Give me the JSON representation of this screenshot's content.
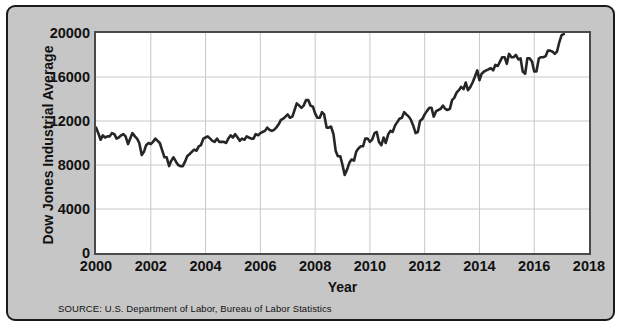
{
  "figure": {
    "source_note": "SOURCE: U.S. Department of Labor, Bureau of Labor Statistics",
    "panel_color": "#c6c6c6",
    "plot_background": "#ffffff",
    "line_color": "#262626",
    "grid_color": "#c8c8c8",
    "frame_color": "#4a4a4a"
  },
  "chart_data": {
    "type": "line",
    "title": "",
    "xlabel": "Year",
    "ylabel": "Dow Jones Industrial Average",
    "xlim": [
      2000,
      2018
    ],
    "ylim": [
      0,
      20000
    ],
    "xticks": [
      2000,
      2002,
      2004,
      2006,
      2008,
      2010,
      2012,
      2014,
      2016,
      2018
    ],
    "xtick_labels": [
      "2000",
      "2002",
      "2004",
      "2006",
      "2008",
      "2010",
      "2012",
      "2014",
      "2016",
      "2018"
    ],
    "yticks": [
      0,
      4000,
      8000,
      12000,
      16000,
      20000
    ],
    "ytick_labels": [
      "0",
      "4000",
      "8000",
      "12000",
      "16000",
      "20000"
    ],
    "grid": true,
    "grid_axis": "both",
    "legend": false,
    "series": [
      {
        "name": "Dow Jones Industrial Average",
        "x": [
          2000.0,
          2000.08,
          2000.17,
          2000.25,
          2000.33,
          2000.42,
          2000.5,
          2000.58,
          2000.67,
          2000.75,
          2000.83,
          2000.92,
          2001.0,
          2001.08,
          2001.17,
          2001.25,
          2001.33,
          2001.42,
          2001.5,
          2001.58,
          2001.67,
          2001.75,
          2001.83,
          2001.92,
          2002.0,
          2002.08,
          2002.17,
          2002.25,
          2002.33,
          2002.42,
          2002.5,
          2002.58,
          2002.67,
          2002.75,
          2002.83,
          2002.92,
          2003.0,
          2003.08,
          2003.17,
          2003.25,
          2003.33,
          2003.42,
          2003.5,
          2003.58,
          2003.67,
          2003.75,
          2003.83,
          2003.92,
          2004.0,
          2004.08,
          2004.17,
          2004.25,
          2004.33,
          2004.42,
          2004.5,
          2004.58,
          2004.67,
          2004.75,
          2004.83,
          2004.92,
          2005.0,
          2005.08,
          2005.17,
          2005.25,
          2005.33,
          2005.42,
          2005.5,
          2005.58,
          2005.67,
          2005.75,
          2005.83,
          2005.92,
          2006.0,
          2006.08,
          2006.17,
          2006.25,
          2006.33,
          2006.42,
          2006.5,
          2006.58,
          2006.67,
          2006.75,
          2006.83,
          2006.92,
          2007.0,
          2007.08,
          2007.17,
          2007.25,
          2007.33,
          2007.42,
          2007.5,
          2007.58,
          2007.67,
          2007.75,
          2007.83,
          2007.92,
          2008.0,
          2008.08,
          2008.17,
          2008.25,
          2008.33,
          2008.42,
          2008.5,
          2008.58,
          2008.67,
          2008.75,
          2008.83,
          2008.92,
          2009.0,
          2009.08,
          2009.17,
          2009.25,
          2009.33,
          2009.42,
          2009.5,
          2009.58,
          2009.67,
          2009.75,
          2009.83,
          2009.92,
          2010.0,
          2010.08,
          2010.17,
          2010.25,
          2010.33,
          2010.42,
          2010.5,
          2010.58,
          2010.67,
          2010.75,
          2010.83,
          2010.92,
          2011.0,
          2011.08,
          2011.17,
          2011.25,
          2011.33,
          2011.42,
          2011.5,
          2011.58,
          2011.67,
          2011.75,
          2011.83,
          2011.92,
          2012.0,
          2012.08,
          2012.17,
          2012.25,
          2012.33,
          2012.42,
          2012.5,
          2012.58,
          2012.67,
          2012.75,
          2012.83,
          2012.92,
          2013.0,
          2013.08,
          2013.17,
          2013.25,
          2013.33,
          2013.42,
          2013.5,
          2013.58,
          2013.67,
          2013.75,
          2013.83,
          2013.92,
          2014.0,
          2014.08,
          2014.17,
          2014.25,
          2014.33,
          2014.42,
          2014.5,
          2014.58,
          2014.67,
          2014.75,
          2014.83,
          2014.92,
          2015.0,
          2015.08,
          2015.17,
          2015.25,
          2015.33,
          2015.42,
          2015.5,
          2015.58,
          2015.67,
          2015.75,
          2015.83,
          2015.92,
          2016.0,
          2016.08,
          2016.17,
          2016.25,
          2016.33,
          2016.42,
          2016.5,
          2016.58,
          2016.67,
          2016.75,
          2016.83,
          2016.92,
          2017.0,
          2017.08
        ],
        "y": [
          11400,
          10900,
          10300,
          10700,
          10500,
          10600,
          10600,
          10900,
          10800,
          10400,
          10500,
          10700,
          10800,
          10600,
          9900,
          10400,
          10900,
          10600,
          10400,
          10000,
          8900,
          9200,
          9800,
          10000,
          9900,
          10100,
          10400,
          10200,
          10000,
          9300,
          8700,
          8700,
          7900,
          8400,
          8700,
          8300,
          8000,
          7900,
          7900,
          8300,
          8800,
          9000,
          9200,
          9400,
          9300,
          9700,
          9800,
          10400,
          10500,
          10600,
          10400,
          10200,
          10100,
          10400,
          10100,
          10100,
          10100,
          10000,
          10400,
          10700,
          10500,
          10800,
          10500,
          10200,
          10400,
          10300,
          10600,
          10500,
          10400,
          10400,
          10800,
          10700,
          10900,
          11000,
          11100,
          11400,
          11200,
          11100,
          11200,
          11400,
          11700,
          12100,
          12200,
          12400,
          12600,
          12300,
          12400,
          13000,
          13600,
          13400,
          13200,
          13400,
          13900,
          13900,
          13400,
          13300,
          12700,
          12300,
          12300,
          12800,
          12600,
          11400,
          11400,
          11500,
          10800,
          9300,
          8800,
          8800,
          8000,
          7100,
          7600,
          8200,
          8500,
          8400,
          9200,
          9500,
          9700,
          9700,
          10400,
          10400,
          10100,
          10300,
          10900,
          11000,
          10100,
          9800,
          10500,
          10000,
          10800,
          11100,
          11000,
          11600,
          11900,
          12200,
          12300,
          12800,
          12600,
          12400,
          12100,
          11600,
          10900,
          11000,
          12000,
          12200,
          12600,
          12900,
          13200,
          13200,
          12400,
          12900,
          13000,
          13100,
          13400,
          13100,
          13000,
          13100,
          13900,
          14100,
          14600,
          14800,
          15100,
          14900,
          15500,
          14800,
          15100,
          15500,
          16000,
          16600,
          15700,
          16300,
          16500,
          16600,
          16700,
          16800,
          16600,
          17100,
          17000,
          17400,
          17800,
          17800,
          17200,
          18100,
          17800,
          17800,
          18000,
          17600,
          17700,
          16500,
          16300,
          17700,
          17700,
          17400,
          16500,
          16500,
          17700,
          17800,
          17800,
          17900,
          18400,
          18400,
          18300,
          18100,
          18300,
          19200,
          19800,
          19900
        ]
      }
    ]
  }
}
